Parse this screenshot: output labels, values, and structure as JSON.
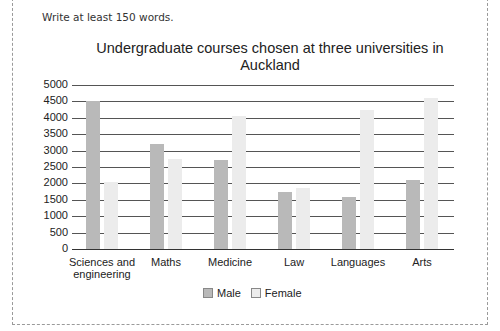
{
  "prompt": "Write at least 150 words.",
  "colors": {
    "male": "#b9b9b9",
    "female": "#ececec",
    "grid": "#555555"
  },
  "chart_data": {
    "type": "bar",
    "title": "Undergraduate courses chosen at three universities in Auckland",
    "title_lines": [
      "Undergraduate courses chosen at three universities in",
      "Auckland"
    ],
    "categories": [
      "Sciences and engineering",
      "Maths",
      "Medicine",
      "Law",
      "Languages",
      "Arts"
    ],
    "category_lines": [
      [
        "Sciences and",
        "engineering"
      ],
      [
        "Maths"
      ],
      [
        "Medicine"
      ],
      [
        "Law"
      ],
      [
        "Languages"
      ],
      [
        "Arts"
      ]
    ],
    "series": [
      {
        "name": "Male",
        "values": [
          4500,
          3200,
          2700,
          1750,
          1600,
          2100
        ]
      },
      {
        "name": "Female",
        "values": [
          2050,
          2750,
          4050,
          1850,
          4250,
          4600
        ]
      }
    ],
    "yticks": [
      0,
      500,
      1000,
      1500,
      2000,
      2500,
      3000,
      3500,
      4000,
      4500,
      5000
    ],
    "ylim": [
      0,
      5000
    ],
    "xlabel": "",
    "ylabel": "",
    "grid": true,
    "legend_position": "bottom"
  }
}
